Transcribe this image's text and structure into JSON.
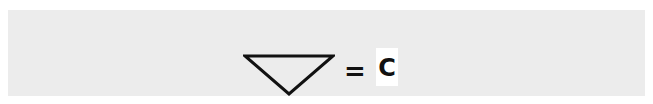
{
  "diagram": {
    "shape": {
      "icon": "inverted-triangle-outline",
      "stroke_color": "#111111"
    },
    "operator": "=",
    "value": "C",
    "colors": {
      "panel_background": "#ececec",
      "value_background": "#ffffff"
    }
  }
}
